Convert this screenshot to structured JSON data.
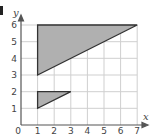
{
  "diagram": {
    "type": "coordinate-grid",
    "x_axis": {
      "label": "x",
      "ticks": [
        "0",
        "1",
        "2",
        "3",
        "4",
        "5",
        "6",
        "7"
      ]
    },
    "y_axis": {
      "label": "y",
      "ticks": [
        "1",
        "2",
        "3",
        "4",
        "5",
        "6"
      ]
    },
    "shapes": [
      {
        "name": "large-triangle",
        "vertices": [
          [
            1,
            6
          ],
          [
            7,
            6
          ],
          [
            1,
            3
          ]
        ],
        "fill": "#b0b0b0",
        "stroke": "#333333"
      },
      {
        "name": "small-triangle",
        "vertices": [
          [
            1,
            2
          ],
          [
            3,
            2
          ],
          [
            1,
            1
          ]
        ],
        "fill": "#b0b0b0",
        "stroke": "#333333"
      }
    ],
    "grid_color": "#cccccc",
    "axis_color": "#555555"
  }
}
